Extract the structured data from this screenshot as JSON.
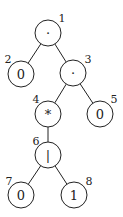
{
  "tree": {
    "nodes": [
      {
        "id": 1,
        "label": "·",
        "index": "1",
        "cx": 48,
        "cy": 33,
        "lx": 62,
        "ly": 18
      },
      {
        "id": 2,
        "label": "0",
        "index": "2",
        "cx": 21,
        "cy": 74,
        "lx": 8,
        "ly": 59
      },
      {
        "id": 3,
        "label": "·",
        "index": "3",
        "cx": 73,
        "cy": 73,
        "lx": 88,
        "ly": 59
      },
      {
        "id": 4,
        "label": "*",
        "index": "4",
        "cx": 48,
        "cy": 114,
        "lx": 36,
        "ly": 99
      },
      {
        "id": 5,
        "label": "0",
        "index": "5",
        "cx": 100,
        "cy": 114,
        "lx": 114,
        "ly": 99
      },
      {
        "id": 6,
        "label": "|",
        "index": "6",
        "cx": 48,
        "cy": 155,
        "lx": 36,
        "ly": 141
      },
      {
        "id": 7,
        "label": "0",
        "index": "7",
        "cx": 21,
        "cy": 195,
        "lx": 9,
        "ly": 181
      },
      {
        "id": 8,
        "label": "1",
        "index": "8",
        "cx": 74,
        "cy": 195,
        "lx": 89,
        "ly": 181
      }
    ],
    "edges": [
      [
        1,
        2
      ],
      [
        1,
        3
      ],
      [
        3,
        4
      ],
      [
        3,
        5
      ],
      [
        4,
        6
      ],
      [
        6,
        7
      ],
      [
        6,
        8
      ]
    ]
  }
}
